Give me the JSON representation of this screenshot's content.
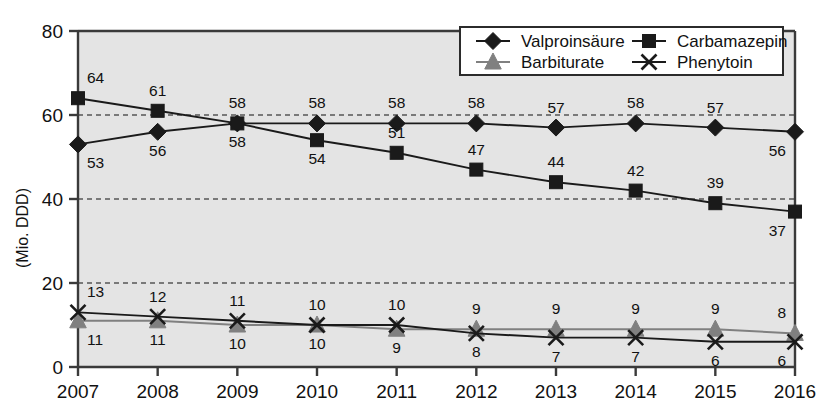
{
  "chart_data": {
    "type": "line",
    "title": "",
    "xlabel": "",
    "ylabel": "(Mio. DDD)",
    "categories": [
      "2007",
      "2008",
      "2009",
      "2010",
      "2011",
      "2012",
      "2013",
      "2014",
      "2015",
      "2016"
    ],
    "ylim": [
      0,
      80
    ],
    "yticks": [
      0,
      20,
      40,
      60,
      80
    ],
    "grid": "horizontal-dashed",
    "legend_position": "top-right",
    "series": [
      {
        "name": "Valproinsäure",
        "marker": "diamond",
        "color": "#1a1a1a",
        "label_side": [
          "below",
          "below",
          "below",
          "above",
          "above",
          "above",
          "above",
          "above",
          "above",
          "below"
        ],
        "values": [
          53,
          56,
          58,
          58,
          58,
          58,
          57,
          58,
          57,
          56
        ]
      },
      {
        "name": "Carbamazepin",
        "marker": "square",
        "color": "#1a1a1a",
        "label_side": [
          "above",
          "above",
          "above",
          "below",
          "above",
          "above",
          "above",
          "above",
          "above",
          "below"
        ],
        "values": [
          64,
          61,
          58,
          54,
          51,
          47,
          44,
          42,
          39,
          37
        ]
      },
      {
        "name": "Barbiturate",
        "marker": "triangle",
        "color": "#808080",
        "label_side": [
          "below",
          "below",
          "below",
          "below",
          "below",
          "above",
          "above",
          "above",
          "above",
          "above"
        ],
        "values": [
          11,
          11,
          10,
          10,
          9,
          9,
          9,
          9,
          9,
          8
        ]
      },
      {
        "name": "Phenytoin",
        "marker": "x",
        "color": "#1a1a1a",
        "label_side": [
          "above",
          "above",
          "above",
          "above",
          "above",
          "below",
          "below",
          "below",
          "below",
          "below"
        ],
        "values": [
          13,
          12,
          11,
          10,
          10,
          8,
          7,
          7,
          6,
          6
        ]
      }
    ]
  },
  "legend": {
    "entries": [
      {
        "label": "Valproinsäure"
      },
      {
        "label": "Carbamazepin"
      },
      {
        "label": "Barbiturate"
      },
      {
        "label": "Phenytoin"
      }
    ]
  },
  "plot_style": {
    "plot_background": "#e4e4e4",
    "axis_color": "#3a3a3a",
    "gridline_color": "#555555",
    "legend_background": "#ffffff",
    "legend_border": "#2b2b2b"
  }
}
